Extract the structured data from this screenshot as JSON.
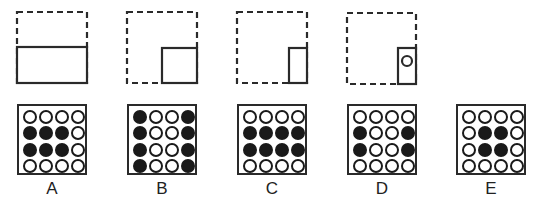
{
  "figures": [
    {
      "id": "A",
      "label": "A",
      "paper": {
        "dashed_square": [
          17,
          12,
          70,
          71
        ],
        "solid_rect": [
          17,
          47,
          70,
          36
        ],
        "hole": null
      },
      "grid": [
        [
          0,
          0,
          0,
          0
        ],
        [
          1,
          1,
          1,
          0
        ],
        [
          1,
          1,
          1,
          0
        ],
        [
          0,
          0,
          0,
          0
        ]
      ]
    },
    {
      "id": "B",
      "label": "B",
      "paper": {
        "dashed_square": [
          127,
          12,
          70,
          71
        ],
        "solid_rect": [
          162,
          48,
          35,
          35
        ],
        "hole": null
      },
      "grid": [
        [
          1,
          0,
          0,
          1
        ],
        [
          1,
          0,
          0,
          1
        ],
        [
          1,
          0,
          0,
          1
        ],
        [
          1,
          0,
          0,
          1
        ]
      ]
    },
    {
      "id": "C",
      "label": "C",
      "paper": {
        "dashed_square": [
          237,
          12,
          70,
          71
        ],
        "solid_rect": [
          289,
          48,
          18,
          35
        ],
        "hole": null
      },
      "grid": [
        [
          0,
          0,
          0,
          0
        ],
        [
          1,
          1,
          1,
          1
        ],
        [
          1,
          1,
          1,
          1
        ],
        [
          0,
          0,
          0,
          0
        ]
      ]
    },
    {
      "id": "D",
      "label": "D",
      "paper": {
        "dashed_square": [
          347,
          13,
          69,
          71
        ],
        "solid_rect": [
          398,
          48,
          18,
          36
        ],
        "hole": {
          "cx": 407,
          "cy": 61,
          "r": 5
        }
      },
      "grid": [
        [
          0,
          0,
          0,
          0
        ],
        [
          1,
          0,
          0,
          1
        ],
        [
          1,
          0,
          0,
          1
        ],
        [
          0,
          0,
          0,
          0
        ]
      ]
    },
    {
      "id": "E",
      "label": "E",
      "paper": null,
      "grid": [
        [
          0,
          0,
          0,
          0
        ],
        [
          0,
          1,
          1,
          0
        ],
        [
          0,
          1,
          1,
          0
        ],
        [
          0,
          0,
          0,
          0
        ]
      ]
    }
  ],
  "grid_positions": [
    {
      "x": 17,
      "y": 104
    },
    {
      "x": 127,
      "y": 104
    },
    {
      "x": 237,
      "y": 104
    },
    {
      "x": 347,
      "y": 104
    },
    {
      "x": 456,
      "y": 104
    }
  ],
  "colors": {
    "stroke": "#2a2a2a",
    "fill": "#1a1a1a",
    "background": "#ffffff"
  }
}
